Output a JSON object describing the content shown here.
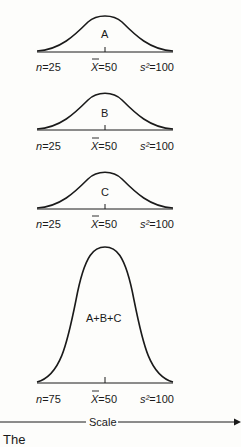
{
  "figure": {
    "panels": [
      {
        "id": "A",
        "label": "A",
        "n": "n",
        "n_value": "=25",
        "mean_symbol": "X",
        "mean_value": "=50",
        "var_symbol": "s²",
        "var_value": "=100"
      },
      {
        "id": "B",
        "label": "B",
        "n": "n",
        "n_value": "=25",
        "mean_symbol": "X",
        "mean_value": "=50",
        "var_symbol": "s²",
        "var_value": "=100"
      },
      {
        "id": "C",
        "label": "C",
        "n": "n",
        "n_value": "=25",
        "mean_symbol": "X",
        "mean_value": "=50",
        "var_symbol": "s²",
        "var_value": "=100"
      },
      {
        "id": "ABC",
        "label": "A+B+C",
        "n": "n",
        "n_value": "=75",
        "mean_symbol": "X",
        "mean_value": "=50",
        "var_symbol": "s²",
        "var_value": "=100"
      }
    ],
    "axis_label": "Scale",
    "caption_fragment": "The"
  }
}
